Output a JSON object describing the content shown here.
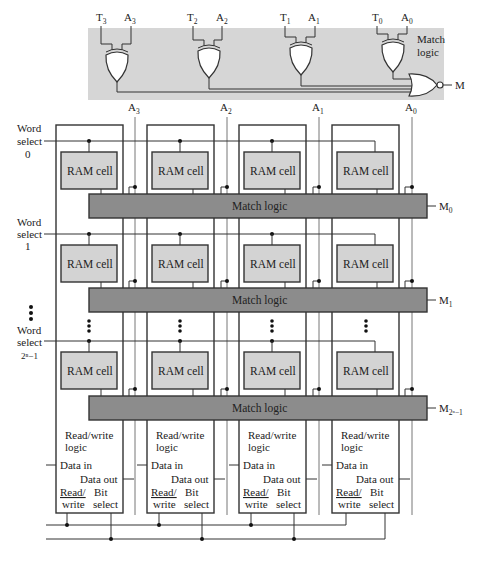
{
  "top_panel": {
    "title_line1": "Match",
    "title_line2": "logic",
    "inputs": [
      {
        "t": "T",
        "t_sub": "3",
        "a": "A",
        "a_sub": "3"
      },
      {
        "t": "T",
        "t_sub": "2",
        "a": "A",
        "a_sub": "2"
      },
      {
        "t": "T",
        "t_sub": "1",
        "a": "A",
        "a_sub": "1"
      },
      {
        "t": "T",
        "t_sub": "0",
        "a": "A",
        "a_sub": "0"
      }
    ],
    "output": "M",
    "gates": [
      "XOR",
      "XOR",
      "XOR",
      "XOR",
      "NOR"
    ]
  },
  "address_lines": [
    {
      "label": "A",
      "sub": "3"
    },
    {
      "label": "A",
      "sub": "2"
    },
    {
      "label": "A",
      "sub": "1"
    },
    {
      "label": "A",
      "sub": "0"
    }
  ],
  "word_selects": [
    {
      "line1": "Word",
      "line2": "select",
      "line3": "0"
    },
    {
      "line1": "Word",
      "line2": "select",
      "line3": "1"
    },
    {
      "line1": "Word",
      "line2": "select",
      "line3": "2ⁿ−1"
    }
  ],
  "ram_cell_label": "RAM cell",
  "match_rows": [
    {
      "label": "Match logic",
      "out": "M",
      "out_sub": "0"
    },
    {
      "label": "Match logic",
      "out": "M",
      "out_sub": "1"
    },
    {
      "label": "Match logic",
      "out": "M",
      "out_sub": "2ⁿ−1"
    }
  ],
  "rw_logic": {
    "title_line1": "Read/write",
    "title_line2": "logic",
    "data_in": "Data in",
    "data_out": "Data out",
    "read": "Read/",
    "write": "write",
    "bit": "Bit",
    "select": "select"
  },
  "colors": {
    "panel": "#d6d6d6",
    "ram_cell": "#d3d3d3",
    "match_logic": "#8c8c8c",
    "line": "#333333"
  }
}
